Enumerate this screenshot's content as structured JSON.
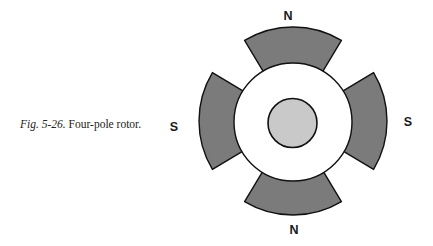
{
  "caption": {
    "figure_ref": "Fig. 5-26.",
    "text": "Four-pole rotor."
  },
  "diagram": {
    "title": "Four-pole rotor",
    "center": [
      293,
      121
    ],
    "pole_outer_radius": 94,
    "rotor_radius": 59,
    "hub_radius": 24.5,
    "pole_half_angle_deg": 31,
    "colors": {
      "pole_fill": "#7b7b7b",
      "rotor_fill": "#ffffff",
      "hub_fill": "#c9c9c9",
      "stroke": "#111111"
    },
    "poles": [
      {
        "position": "top",
        "label": "N"
      },
      {
        "position": "right",
        "label": "S"
      },
      {
        "position": "bottom",
        "label": "N"
      },
      {
        "position": "left",
        "label": "S"
      }
    ]
  }
}
